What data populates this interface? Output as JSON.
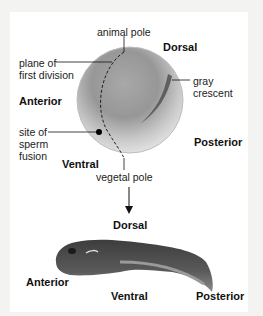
{
  "diagram": {
    "egg_labels": {
      "animal_pole": "animal pole",
      "plane_line1": "plane of",
      "plane_line2": "first division",
      "gray_line1": "gray",
      "gray_line2": "crescent",
      "sperm_line1": "site of",
      "sperm_line2": "sperm",
      "sperm_line3": "fusion",
      "vegetal_pole": "vegetal pole"
    },
    "egg_axes": {
      "dorsal": "Dorsal",
      "anterior": "Anterior",
      "posterior": "Posterior",
      "ventral": "Ventral"
    },
    "tadpole_axes": {
      "dorsal": "Dorsal",
      "anterior": "Anterior",
      "ventral": "Ventral",
      "posterior": "Posterior"
    },
    "colors": {
      "egg_top": "#8d8d8d",
      "egg_bottom": "#e6e6e6",
      "gray_crescent": "#6a6a6a",
      "tadpole": "#4a4a4a"
    }
  }
}
